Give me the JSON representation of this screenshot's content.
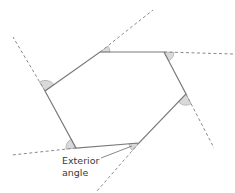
{
  "diagram": {
    "type": "hexagon-exterior-angles",
    "shape": "irregular hexagon",
    "vertices": [
      {
        "id": "top-left",
        "x": 100,
        "y": 52
      },
      {
        "id": "top-right",
        "x": 164,
        "y": 52
      },
      {
        "id": "right",
        "x": 186,
        "y": 94
      },
      {
        "id": "bottom-right",
        "x": 139,
        "y": 143
      },
      {
        "id": "bottom-left",
        "x": 76,
        "y": 148
      },
      {
        "id": "left",
        "x": 45,
        "y": 91
      }
    ],
    "extensions": [
      {
        "from": "top-left",
        "to": [
          153,
          10
        ]
      },
      {
        "from": "top-right",
        "to": [
          233,
          54
        ]
      },
      {
        "from": "right",
        "to": [
          214,
          148
        ]
      },
      {
        "from": "bottom-right",
        "to": [
          97,
          191
        ]
      },
      {
        "from": "bottom-left",
        "to": [
          12,
          155
        ]
      },
      {
        "from": "left",
        "to": [
          13,
          37
        ]
      }
    ],
    "exterior_angle_count": 6,
    "colors": {
      "edge": "#7a7a7a",
      "dashed": "#8a8a8a",
      "angle_fill": "#d9d9d9",
      "text": "#3a3a3a"
    }
  },
  "annotation": {
    "line1": "Exterior",
    "line2": "angle"
  }
}
